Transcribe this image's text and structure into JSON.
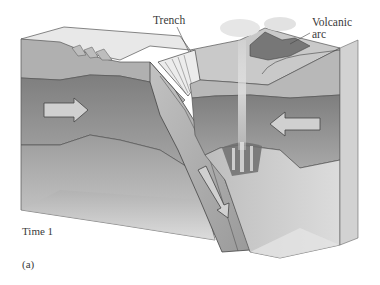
{
  "figure": {
    "panel_label": "(a)",
    "time_label": "Time 1",
    "labels": {
      "trench": "Trench",
      "volcanic_arc_line1": "Volcanic",
      "volcanic_arc_line2": "arc"
    },
    "elements": [
      {
        "name": "oceanic-lithosphere",
        "shade": "#a9a9a9"
      },
      {
        "name": "asthenosphere",
        "shade": "#8c8c8c"
      },
      {
        "name": "subducting-slab",
        "shade": "#b4b4b4"
      },
      {
        "name": "accretionary-wedge",
        "shade": "#e6e6e6"
      },
      {
        "name": "continental-lithosphere",
        "shade": "#b8b8b8"
      },
      {
        "name": "volcanic-arc",
        "shade": "#7a7a7a"
      },
      {
        "name": "magma-column",
        "shade": "#d8d8d8"
      }
    ],
    "arrows": [
      {
        "name": "plate-motion-right",
        "direction": "right"
      },
      {
        "name": "plate-motion-left",
        "direction": "left"
      },
      {
        "name": "slab-descent",
        "direction": "down-right"
      }
    ]
  }
}
